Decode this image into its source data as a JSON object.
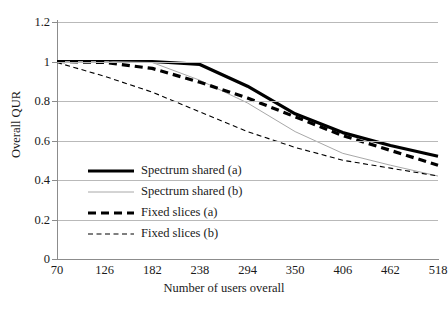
{
  "chart_data": {
    "type": "line",
    "title": "",
    "xlabel": "Number of users overall",
    "ylabel": "Overall QUR",
    "x": [
      70,
      126,
      182,
      238,
      294,
      350,
      406,
      462,
      518
    ],
    "xlim": [
      70,
      518
    ],
    "ylim": [
      0,
      1.2
    ],
    "yticks": [
      0,
      0.2,
      0.4,
      0.6,
      0.8,
      1,
      1.2
    ],
    "ytick_labels": [
      "0",
      "0.2",
      "0.4",
      "0.6",
      "0.8",
      "1",
      "1.2"
    ],
    "xtick_labels": [
      "70",
      "126",
      "182",
      "238",
      "294",
      "350",
      "406",
      "462",
      "518"
    ],
    "grid": "horizontal",
    "legend_position": "center-left-inside",
    "series": [
      {
        "name": "Spectrum shared (a)",
        "style": "solid",
        "width": "thick",
        "color": "#000000",
        "values": [
          1.0,
          1.0,
          1.0,
          0.985,
          0.875,
          0.735,
          0.64,
          0.575,
          0.52
        ]
      },
      {
        "name": "Spectrum shared (b)",
        "style": "solid",
        "width": "thin",
        "color": "#a8a8a8",
        "values": [
          1.0,
          1.0,
          0.995,
          0.905,
          0.79,
          0.645,
          0.535,
          0.475,
          0.42
        ]
      },
      {
        "name": "Fixed slices (a)",
        "style": "dashed",
        "width": "thick",
        "color": "#000000",
        "values": [
          1.0,
          0.995,
          0.965,
          0.895,
          0.815,
          0.72,
          0.625,
          0.55,
          0.475
        ]
      },
      {
        "name": "Fixed slices (b)",
        "style": "dashed",
        "width": "thin",
        "color": "#000000",
        "values": [
          0.995,
          0.925,
          0.845,
          0.745,
          0.645,
          0.565,
          0.5,
          0.46,
          0.42
        ]
      }
    ]
  },
  "axes": {
    "y_title": "Overall QUR",
    "x_title": "Number of users overall"
  },
  "legend": {
    "items": [
      {
        "label": "Spectrum shared (a)"
      },
      {
        "label": "Spectrum shared (b)"
      },
      {
        "label": "Fixed slices (a)"
      },
      {
        "label": "Fixed slices (b)"
      }
    ]
  }
}
